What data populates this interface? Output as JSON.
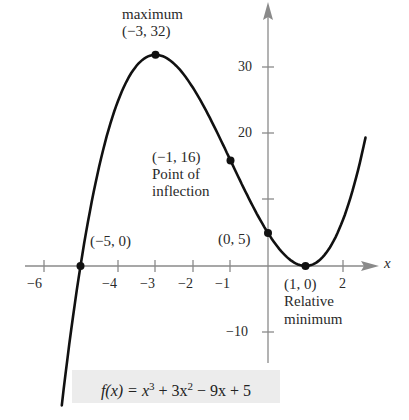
{
  "chart_data": {
    "type": "line",
    "title": "",
    "function": "f(x) = x^3 + 3x^2 - 9x + 5",
    "xlabel": "x",
    "ylabel": "",
    "xlim": [
      -6.5,
      3.2
    ],
    "ylim": [
      -14,
      38
    ],
    "grid": false,
    "x_ticks": [
      -6,
      -4,
      -3,
      -2,
      -1,
      2
    ],
    "y_ticks": [
      -10,
      20,
      30
    ],
    "series": [
      {
        "name": "f(x)",
        "x": [
          -5.5,
          -5,
          -4,
          -3,
          -2,
          -1,
          0,
          1,
          2,
          2.6
        ],
        "y": [
          -13.125,
          0,
          25,
          32,
          27,
          16,
          5,
          0,
          7,
          18.2
        ]
      }
    ],
    "points": [
      {
        "x": -3,
        "y": 32,
        "label": "(−3, 32)",
        "note": "maximum"
      },
      {
        "x": -1,
        "y": 16,
        "label": "(−1, 16)",
        "note": "Point of inflection"
      },
      {
        "x": 0,
        "y": 5,
        "label": "(0, 5)",
        "note": ""
      },
      {
        "x": 1,
        "y": 0,
        "label": "(1, 0)",
        "note": "Relative minimum"
      },
      {
        "x": -5,
        "y": 0,
        "label": "(−5, 0)",
        "note": ""
      }
    ]
  },
  "labels": {
    "max_title": "maximum",
    "max_point": "(−3, 32)",
    "inflection_point": "(−1, 16)",
    "inflection_line1": "Point of",
    "inflection_line2": "inflection",
    "zero_neg5": "(−5, 0)",
    "y_intercept": "(0, 5)",
    "min_point": "(1, 0)",
    "min_line1": "Relative",
    "min_line2": "minimum",
    "x_axis": "x"
  },
  "ticks": {
    "x": {
      "m6": "−6",
      "m4": "−4",
      "m3": "−3",
      "m2": "−2",
      "m1": "−1",
      "p2": "2"
    },
    "y": {
      "p30": "30",
      "p20": "20",
      "m10": "−10"
    }
  },
  "formula": {
    "lhs": "f(x) = x",
    "exp3": "3",
    "mid": " + 3x",
    "exp2": "2",
    "rhs": " − 9x + 5"
  },
  "colors": {
    "curve": "#111111",
    "axis": "#8a8a8a",
    "formula_bg": "#ececec"
  }
}
